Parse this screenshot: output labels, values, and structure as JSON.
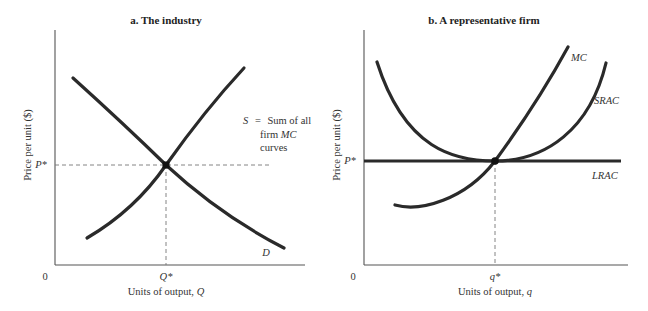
{
  "panels": [
    {
      "id": "industry",
      "title": "a. The industry",
      "ylabel": "Price per unit ($)",
      "xlabel_text": "Units of output, ",
      "xlabel_var": "Q",
      "origin": "0",
      "price_tick": "P*",
      "quantity_tick": "Q*",
      "curves": {
        "supply": {
          "letter": "S",
          "eq": "=",
          "line1": "Sum of all",
          "line2_a": "firm ",
          "line2_b": "MC",
          "line3": "curves"
        },
        "demand": {
          "letter": "D"
        }
      }
    },
    {
      "id": "firm",
      "title": "b. A representative firm",
      "ylabel": "Price per unit ($)",
      "xlabel_text": "Units of output, ",
      "xlabel_var": "q",
      "origin": "0",
      "price_tick": "P*",
      "quantity_tick": "q*",
      "curves": {
        "mc": {
          "label": "MC"
        },
        "srac": {
          "label": "SRAC"
        },
        "lrac": {
          "label": "LRAC"
        }
      }
    }
  ],
  "colors": {
    "curve": "#2a2a2a",
    "axis": "#555555",
    "dash": "#777777",
    "text": "#333333"
  }
}
